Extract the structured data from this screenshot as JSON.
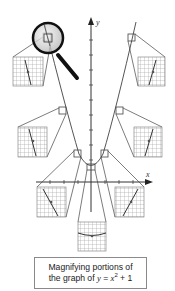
{
  "figure": {
    "axis_labels": {
      "x": "x",
      "y": "y"
    },
    "function": "y = x^2 + 1",
    "colors": {
      "curve": "#555555",
      "axes": "#333333",
      "grid": "#9a9a9a",
      "box": "#444444",
      "magnifier_rim": "#111111",
      "lens": "#d8d8d8"
    }
  },
  "caption": {
    "line1": "Magnifying portions of",
    "line2_prefix": "the graph of ",
    "line2_math_y": "y",
    "line2_eq": " = ",
    "line2_math_x": "x",
    "line2_exp": "2",
    "line2_suffix": " + 1"
  }
}
